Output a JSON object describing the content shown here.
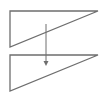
{
  "diagram": {
    "background": "#ffffff",
    "stroke_color": "#6e6e6e",
    "fill_color": "#ffffff",
    "stroke_width": 1.3,
    "shapes": [
      {
        "name": "top-triangle",
        "type": "right-triangle",
        "points": [
          [
            10,
            11
          ],
          [
            98,
            11
          ],
          [
            10,
            47
          ]
        ]
      },
      {
        "name": "bottom-triangle",
        "type": "right-triangle",
        "points": [
          [
            10,
            55
          ],
          [
            98,
            55
          ],
          [
            10,
            91
          ]
        ]
      }
    ],
    "arrow": {
      "name": "down-arrow",
      "direction": "down",
      "x": 46,
      "y_start": 24,
      "y_end": 66
    }
  }
}
